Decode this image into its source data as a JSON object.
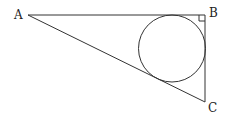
{
  "diagram": {
    "points": {
      "A": {
        "label": "A",
        "x": 28,
        "y": 15
      },
      "B": {
        "label": "B",
        "x": 205,
        "y": 15
      },
      "C": {
        "label": "C",
        "x": 205,
        "y": 102
      }
    },
    "circle": {
      "cx": 172,
      "cy": 48.5,
      "r": 33.5
    },
    "right_angle_at": "B",
    "colors": {
      "stroke": "#333333",
      "text": "#222222",
      "background": "#ffffff"
    }
  }
}
